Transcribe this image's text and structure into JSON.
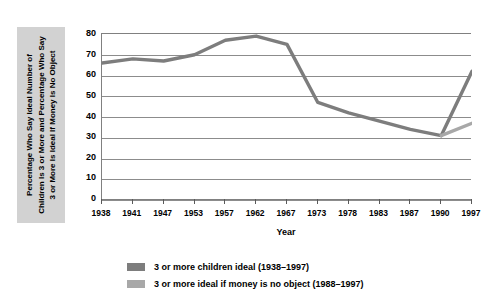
{
  "axis_title_y_lines": [
    "Percentage  Who Say Ideal Number of",
    "Children Is 3 or More and Percentage  Who Say",
    "3 or More Is Ideal If Money Is No Object"
  ],
  "axis_title_x": "Year",
  "legend": [
    {
      "label": "3 or more children ideal (1938–1997)",
      "color": "#7d7d7d",
      "swatch_name": "legend-swatch-children-ideal"
    },
    {
      "label": "3 or more ideal if money is no object (1988–1997)",
      "color": "#a8a8a8",
      "swatch_name": "legend-swatch-money-no-object"
    }
  ],
  "chart_data": {
    "type": "line",
    "title": "",
    "subtitle": "",
    "xlabel": "Year",
    "ylabel": "Percentage  Who Say Ideal Number of Children Is 3 or More and Percentage  Who Say 3 or More Is Ideal If Money Is No Object",
    "categories": [
      "1938",
      "1941",
      "1947",
      "1953",
      "1957",
      "1962",
      "1967",
      "1973",
      "1978",
      "1983",
      "1987",
      "1990",
      "1997"
    ],
    "ylim": [
      0,
      80
    ],
    "yticks": [
      0,
      10,
      20,
      30,
      40,
      50,
      60,
      70,
      80
    ],
    "grid": true,
    "legend_position": "bottom",
    "series": [
      {
        "name": "3 or more children ideal (1938–1997)",
        "color": "#7d7d7d",
        "values": [
          66,
          68,
          67,
          70,
          77,
          79,
          75,
          47,
          42,
          38,
          34,
          31,
          62
        ]
      },
      {
        "name": "3 or more ideal if money is no object (1988–1997)",
        "color": "#a8a8a8",
        "values": [
          null,
          null,
          null,
          null,
          null,
          null,
          null,
          null,
          null,
          null,
          null,
          31,
          37
        ]
      }
    ]
  },
  "colors": {
    "plot_background": "#ffffff",
    "gridline": "#8c8c8c",
    "axis": "#808080",
    "ylabel_box": "#d2d2d2",
    "text": "#000000"
  }
}
